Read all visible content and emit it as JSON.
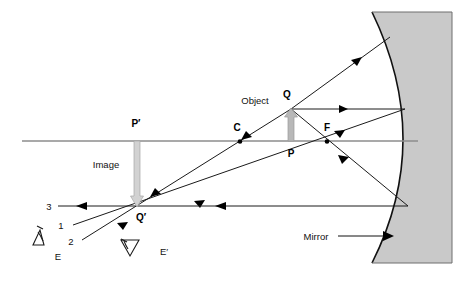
{
  "figure": {
    "type": "optics-ray-diagram"
  },
  "labels": {
    "object": "Object",
    "image": "Image",
    "mirror": "Mirror",
    "point_Q": "Q",
    "point_P": "P",
    "point_C": "C",
    "point_F": "F",
    "point_Pprime": "P′",
    "point_Qprime": "Q′",
    "ray_1": "1",
    "ray_2": "2",
    "ray_3": "3",
    "eye_E": "E",
    "eye_Eprime": "E′"
  },
  "colors": {
    "ray_stroke": "#1a1a1a",
    "axis_stroke": "#8c8c8c",
    "mirror_fill": "#c9c9c9",
    "mirror_face": "#111111",
    "object_arrow_fill": "#b8b8b8",
    "image_arrow_fill": "#d2d2d2",
    "background": "#ffffff",
    "text": "#111111"
  },
  "geometry": {
    "axis_y": 141,
    "axis_x_start": 22,
    "axis_x_end": 418,
    "point_C": [
      240,
      141
    ],
    "point_F": [
      327,
      141
    ],
    "point_P": [
      291,
      141
    ],
    "point_Q": [
      291,
      109
    ],
    "point_Pprime": [
      137,
      141
    ],
    "point_Qprime": [
      137,
      206
    ],
    "mirror_vertex_x": 418,
    "ray3_line_y": 206
  }
}
